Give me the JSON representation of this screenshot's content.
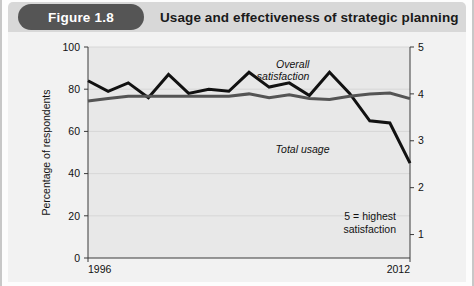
{
  "header": {
    "badge": "Figure 1.8",
    "title": "Usage and effectiveness of strategic planning"
  },
  "colors": {
    "header_bar": "#d8d8d8",
    "badge_bg": "#555555",
    "badge_text": "#ffffff",
    "plot_bg": "#e8e8e8",
    "panel_bg": "#f2f2f2",
    "total_usage_line": "#111111",
    "overall_satisfaction_line": "#555555",
    "axis": "#3a3a3a",
    "gridline": "#d2d2d2"
  },
  "chart_data": {
    "type": "line",
    "title": "Usage and effectiveness of strategic planning",
    "xlabel": "",
    "ylabel": "Percentage of respondents",
    "y2label": "",
    "xlim": [
      1996,
      2012
    ],
    "ylim": [
      0,
      100
    ],
    "y2lim": [
      0.5,
      5
    ],
    "grid": true,
    "legend": "annotated-inline",
    "note": [
      "5 = highest",
      "satisfaction"
    ],
    "x_tick_labels": [
      "1996",
      "2012"
    ],
    "y_tick_labels": [
      "0",
      "20",
      "40",
      "60",
      "80",
      "100"
    ],
    "y_ticks": [
      0,
      20,
      40,
      60,
      80,
      100
    ],
    "y2_tick_labels": [
      "1",
      "2",
      "3",
      "4",
      "5"
    ],
    "y2_ticks": [
      1,
      2,
      3,
      4,
      5
    ],
    "x": [
      1996,
      1997,
      1998,
      1999,
      2000,
      2001,
      2002,
      2003,
      2004,
      2005,
      2006,
      2007,
      2008,
      2009,
      2010,
      2011,
      2012
    ],
    "series": [
      {
        "name": "Total usage",
        "axis": "left",
        "units": "percent",
        "color": "#111111",
        "label": "Total usage",
        "label_x": 2008,
        "label_y": 50,
        "values": [
          84,
          79,
          83,
          76,
          87,
          78,
          80,
          79,
          88,
          81,
          83,
          77,
          88,
          78,
          65,
          64,
          45
        ]
      },
      {
        "name": "Overall satisfaction",
        "axis": "right",
        "units": "rating",
        "color": "#555555",
        "label": "Overall satisfaction",
        "label_x": 2007,
        "label_y": 4.55,
        "values": [
          3.85,
          3.9,
          3.95,
          3.95,
          3.95,
          3.95,
          3.95,
          3.95,
          4.0,
          3.92,
          3.98,
          3.9,
          3.88,
          3.95,
          4.0,
          4.02,
          3.9
        ]
      }
    ]
  }
}
